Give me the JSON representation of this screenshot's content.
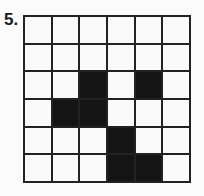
{
  "problem": {
    "label": "5.",
    "grid": {
      "rows": 6,
      "cols": 6,
      "cells": [
        [
          0,
          0,
          0,
          0,
          0,
          0
        ],
        [
          0,
          0,
          0,
          0,
          0,
          0
        ],
        [
          0,
          0,
          1,
          0,
          1,
          0
        ],
        [
          0,
          1,
          1,
          0,
          0,
          0
        ],
        [
          0,
          0,
          0,
          1,
          0,
          0
        ],
        [
          0,
          0,
          0,
          1,
          1,
          0
        ]
      ]
    }
  }
}
